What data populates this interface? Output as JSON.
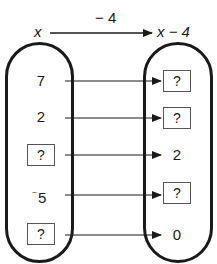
{
  "header": {
    "input_label": "x",
    "operation": "− 4",
    "output_label": "x − 4"
  },
  "mapping": {
    "rows": [
      {
        "input": "7",
        "input_unknown": false,
        "output": "?",
        "output_unknown": true
      },
      {
        "input": "2",
        "input_unknown": false,
        "output": "?",
        "output_unknown": true
      },
      {
        "input": "?",
        "input_unknown": true,
        "output": "2",
        "output_unknown": false
      },
      {
        "input": "5",
        "input_sign": "⁻",
        "input_unknown": false,
        "output": "?",
        "output_unknown": true
      },
      {
        "input": "?",
        "input_unknown": true,
        "output": "0",
        "output_unknown": false
      }
    ]
  },
  "colors": {
    "stroke": "#1a1a1a",
    "box_border": "#555555",
    "background": "#ffffff"
  }
}
